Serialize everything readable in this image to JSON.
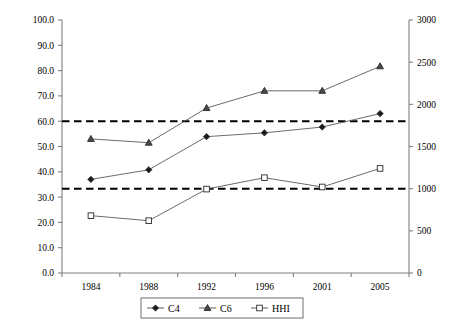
{
  "chart_data": {
    "type": "line",
    "title": "",
    "subtitle": "",
    "xlabel": "",
    "ylabel": "",
    "y2label": "",
    "categories": [
      "1984",
      "1988",
      "1992",
      "1996",
      "2001",
      "2005"
    ],
    "ylim": [
      0,
      100
    ],
    "y2lim": [
      0,
      3000
    ],
    "yticks": [
      "0.0",
      "10.0",
      "20.0",
      "30.0",
      "40.0",
      "50.0",
      "60.0",
      "70.0",
      "80.0",
      "90.0",
      "100.0"
    ],
    "y2ticks": [
      "0",
      "500",
      "1000",
      "1500",
      "2000",
      "2500",
      "3000"
    ],
    "grid": false,
    "legend_position": "bottom-center",
    "series": [
      {
        "name": "C4",
        "axis": "left",
        "marker": "diamond",
        "values": [
          37.0,
          40.8,
          53.9,
          55.4,
          57.7,
          63.0
        ]
      },
      {
        "name": "C6",
        "axis": "left",
        "marker": "triangle",
        "values": [
          53.0,
          51.5,
          65.2,
          72.0,
          72.0,
          81.7
        ]
      },
      {
        "name": "HHI",
        "axis": "right",
        "marker": "square",
        "values": [
          680,
          620,
          995,
          1130,
          1020,
          1240
        ]
      }
    ],
    "reference_lines": [
      {
        "name": "upper-threshold",
        "left_value": 60.0,
        "right_value": 1800,
        "style": "dashed"
      },
      {
        "name": "lower-threshold",
        "left_value": 33.3,
        "right_value": 1000,
        "style": "dashed"
      }
    ],
    "legend": [
      {
        "label": "C4",
        "marker": "diamond"
      },
      {
        "label": "C6",
        "marker": "triangle"
      },
      {
        "label": "HHI",
        "marker": "square"
      }
    ]
  }
}
